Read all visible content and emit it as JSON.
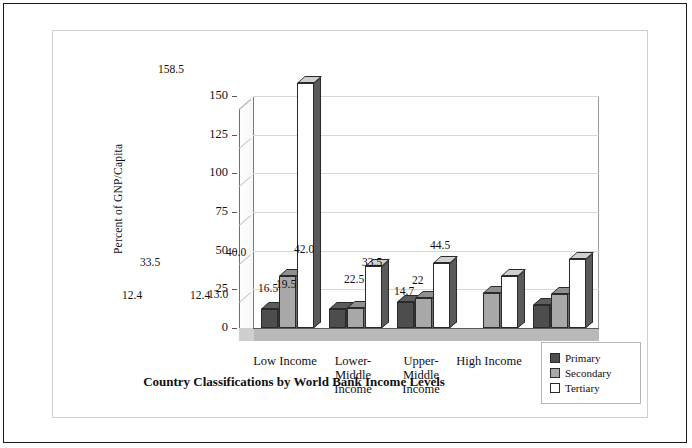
{
  "chart_data": {
    "type": "bar",
    "title": "Country Classifications by World Bank Income Levels",
    "xlabel": "",
    "ylabel": "Percent of GNP/Capita",
    "ylim": [
      0,
      150
    ],
    "yticks": [
      "0",
      "25",
      "50",
      "75",
      "100",
      "125",
      "150"
    ],
    "grid": true,
    "legend_position": "bottom-right",
    "categories": [
      "Low Income",
      "Lower-Middle Income",
      "Upper-Middle Income",
      "High Income",
      "Total"
    ],
    "category_lines": [
      [
        "Low Income"
      ],
      [
        "Lower-",
        "Middle",
        "Income"
      ],
      [
        "Upper-",
        "Middle",
        "Income"
      ],
      [
        "High Income"
      ],
      [
        "Total"
      ]
    ],
    "series": [
      {
        "name": "Primary",
        "color": "#4d4d4d",
        "values": [
          12.4,
          12.4,
          16.5,
          null,
          14.7
        ],
        "labels": [
          "12.4",
          "12.4",
          "16.5",
          "",
          "14.7"
        ]
      },
      {
        "name": "Secondary",
        "color": "#a8a8a8",
        "values": [
          33.5,
          13.0,
          19.5,
          22.5,
          22.0
        ],
        "labels": [
          "33.5",
          "13.0",
          "19.5",
          "22.5",
          "22"
        ]
      },
      {
        "name": "Tertiary",
        "color": "#ffffff",
        "values": [
          158.5,
          40.0,
          42.0,
          33.5,
          44.5
        ],
        "labels": [
          "158.5",
          "40.0",
          "42.0",
          "33.5",
          "44.5"
        ]
      }
    ]
  }
}
